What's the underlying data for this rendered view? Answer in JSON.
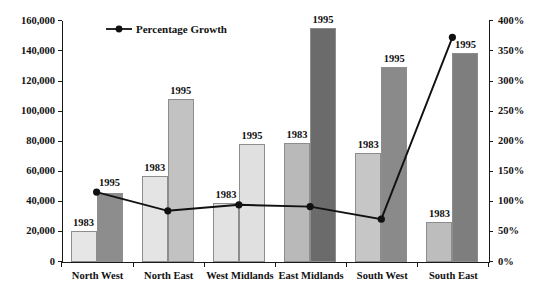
{
  "chart_data": {
    "type": "bar",
    "title": "",
    "subtitle": "",
    "xlabel": "",
    "ylabel": "",
    "y2label": "",
    "categories": [
      "North West",
      "North East",
      "West Midlands",
      "East Midlands",
      "South West",
      "South East"
    ],
    "series": [
      {
        "name": "1983",
        "type": "bar",
        "axis": "left",
        "values": [
          20500,
          57000,
          39000,
          79000,
          72500,
          26500
        ],
        "point_labels": [
          "1983",
          "1983",
          "1983",
          "1983",
          "1983",
          "1983"
        ]
      },
      {
        "name": "1995",
        "type": "bar",
        "axis": "left",
        "values": [
          45500,
          108500,
          78500,
          155500,
          129500,
          138500
        ],
        "point_labels": [
          "1995",
          "1995",
          "1995",
          "1995",
          "1995",
          "1995"
        ]
      },
      {
        "name": "Percentage Growth",
        "type": "line",
        "axis": "right",
        "values": [
          116,
          85,
          95,
          92,
          71,
          373
        ]
      }
    ],
    "ylim": [
      0,
      160000
    ],
    "yticks": [
      0,
      20000,
      40000,
      60000,
      80000,
      100000,
      120000,
      140000,
      160000
    ],
    "ytick_labels": [
      "0",
      "20,000",
      "40,000",
      "60,000",
      "80,000",
      "100,000",
      "120,000",
      "140,000",
      "160,000"
    ],
    "y2lim": [
      0,
      400
    ],
    "y2ticks": [
      0,
      50,
      100,
      150,
      200,
      250,
      300,
      350,
      400
    ],
    "y2tick_labels": [
      "0%",
      "50%",
      "100%",
      "150%",
      "200%",
      "250%",
      "300%",
      "350%",
      "400%"
    ],
    "grid": false,
    "legend": {
      "position": "top-left-inside",
      "entries": [
        "Percentage Growth"
      ]
    },
    "colors": {
      "bar_1983": "#e3e3e3",
      "bar_1995": "#8e8e8e",
      "line": "#111111",
      "axis": "#1a1a1a",
      "text": "#111111",
      "background": "#ffffff"
    }
  },
  "legend": {
    "growth_label": "Percentage Growth"
  }
}
